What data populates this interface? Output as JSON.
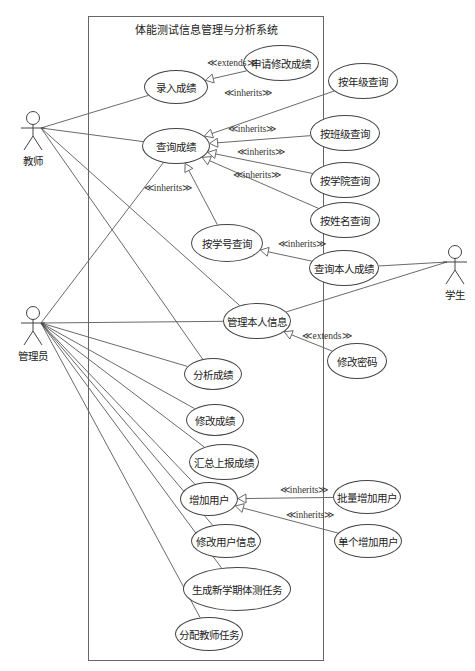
{
  "system": {
    "title": "体能测试信息管理与分析系统",
    "box": {
      "x": 88,
      "y": 16,
      "w": 236,
      "h": 645
    }
  },
  "actors": [
    {
      "id": "teacher",
      "label": "教师",
      "x": 33,
      "y": 128
    },
    {
      "id": "admin",
      "label": "管理员",
      "x": 33,
      "y": 323
    },
    {
      "id": "student",
      "label": "学生",
      "x": 455,
      "y": 262
    }
  ],
  "use_cases": [
    {
      "id": "enter_scores",
      "label": "录入成绩",
      "cx": 176,
      "cy": 87,
      "rx": 32,
      "ry": 17
    },
    {
      "id": "request_modify",
      "label": "申请修改成绩",
      "cx": 281,
      "cy": 63,
      "rx": 38,
      "ry": 18
    },
    {
      "id": "query_by_grade",
      "label": "按年级查询",
      "cx": 363,
      "cy": 81,
      "rx": 35,
      "ry": 18
    },
    {
      "id": "query_scores",
      "label": "查询成绩",
      "cx": 176,
      "cy": 146,
      "rx": 34,
      "ry": 18
    },
    {
      "id": "query_by_class",
      "label": "按班级查询",
      "cx": 345,
      "cy": 133,
      "rx": 35,
      "ry": 18
    },
    {
      "id": "query_by_college",
      "label": "按学院查询",
      "cx": 345,
      "cy": 180,
      "rx": 35,
      "ry": 18
    },
    {
      "id": "query_by_name",
      "label": "按姓名查询",
      "cx": 345,
      "cy": 220,
      "rx": 35,
      "ry": 18
    },
    {
      "id": "query_by_student_no",
      "label": "按学号查询",
      "cx": 227,
      "cy": 243,
      "rx": 36,
      "ry": 19
    },
    {
      "id": "query_own_scores",
      "label": "查询本人成绩",
      "cx": 344,
      "cy": 268,
      "rx": 35,
      "ry": 18
    },
    {
      "id": "manage_own_info",
      "label": "管理本人信息",
      "cx": 257,
      "cy": 321,
      "rx": 34,
      "ry": 18
    },
    {
      "id": "change_password",
      "label": "修改密码",
      "cx": 357,
      "cy": 361,
      "rx": 30,
      "ry": 18
    },
    {
      "id": "analyze_scores",
      "label": "分析成绩",
      "cx": 213,
      "cy": 374,
      "rx": 29,
      "ry": 16
    },
    {
      "id": "modify_scores",
      "label": "修改成绩",
      "cx": 215,
      "cy": 420,
      "rx": 29,
      "ry": 16
    },
    {
      "id": "summarize_report",
      "label": "汇总上报成绩",
      "cx": 224,
      "cy": 462,
      "rx": 35,
      "ry": 18
    },
    {
      "id": "add_users",
      "label": "增加用户",
      "cx": 209,
      "cy": 499,
      "rx": 29,
      "ry": 17
    },
    {
      "id": "batch_add_users",
      "label": "批量增加用户",
      "cx": 367,
      "cy": 497,
      "rx": 34,
      "ry": 17
    },
    {
      "id": "edit_user_info",
      "label": "修改用户信息",
      "cx": 226,
      "cy": 541,
      "rx": 35,
      "ry": 17
    },
    {
      "id": "add_single_user",
      "label": "单个增加用户",
      "cx": 368,
      "cy": 541,
      "rx": 34,
      "ry": 17
    },
    {
      "id": "generate_semester_tasks",
      "label": "生成新学期体测任务",
      "cx": 237,
      "cy": 589,
      "rx": 54,
      "ry": 22
    },
    {
      "id": "assign_teacher_tasks",
      "label": "分配教师任务",
      "cx": 209,
      "cy": 634,
      "rx": 34,
      "ry": 17
    }
  ],
  "stereotypes": [
    {
      "label": "≪extends≫",
      "x": 232,
      "y": 64
    },
    {
      "label": "≪inherits≫",
      "x": 248,
      "y": 94
    },
    {
      "label": "≪inherits≫",
      "x": 252,
      "y": 130
    },
    {
      "label": "≪inherits≫",
      "x": 261,
      "y": 153
    },
    {
      "label": "≪inherits≫",
      "x": 257,
      "y": 176
    },
    {
      "label": "≪inherits≫",
      "x": 168,
      "y": 189
    },
    {
      "label": "≪inherits≫",
      "x": 302,
      "y": 245
    },
    {
      "label": "≪extends≫",
      "x": 327,
      "y": 337
    },
    {
      "label": "≪inherits≫",
      "x": 304,
      "y": 491
    },
    {
      "label": "≪inherits≫",
      "x": 310,
      "y": 516
    }
  ],
  "associations": [
    {
      "from": "teacher",
      "to": "enter_scores"
    },
    {
      "from": "teacher",
      "to": "query_scores"
    },
    {
      "from": "teacher",
      "to": "manage_own_info"
    },
    {
      "from": "teacher",
      "to": "analyze_scores"
    },
    {
      "from": "admin",
      "to": "query_scores"
    },
    {
      "from": "admin",
      "to": "manage_own_info"
    },
    {
      "from": "admin",
      "to": "analyze_scores"
    },
    {
      "from": "admin",
      "to": "modify_scores"
    },
    {
      "from": "admin",
      "to": "summarize_report"
    },
    {
      "from": "admin",
      "to": "add_users"
    },
    {
      "from": "admin",
      "to": "edit_user_info"
    },
    {
      "from": "admin",
      "to": "generate_semester_tasks"
    },
    {
      "from": "admin",
      "to": "assign_teacher_tasks"
    },
    {
      "from": "student",
      "to": "query_own_scores"
    },
    {
      "from": "student",
      "to": "manage_own_info"
    }
  ],
  "relations": [
    {
      "type": "extends",
      "from": "request_modify",
      "to": "enter_scores"
    },
    {
      "type": "inherits",
      "from": "query_by_grade",
      "to": "query_scores"
    },
    {
      "type": "inherits",
      "from": "query_by_class",
      "to": "query_scores"
    },
    {
      "type": "inherits",
      "from": "query_by_college",
      "to": "query_scores"
    },
    {
      "type": "inherits",
      "from": "query_by_name",
      "to": "query_scores"
    },
    {
      "type": "inherits",
      "from": "query_by_student_no",
      "to": "query_scores"
    },
    {
      "type": "inherits",
      "from": "query_own_scores",
      "to": "query_by_student_no"
    },
    {
      "type": "extends",
      "from": "change_password",
      "to": "manage_own_info"
    },
    {
      "type": "inherits",
      "from": "batch_add_users",
      "to": "add_users"
    },
    {
      "type": "inherits",
      "from": "add_single_user",
      "to": "add_users"
    }
  ],
  "colors": {
    "line": "#444444",
    "text": "#222222",
    "box": "#666666"
  }
}
